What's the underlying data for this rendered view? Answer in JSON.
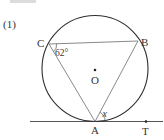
{
  "problem": {
    "number_label": "(1)"
  },
  "figure": {
    "circle": {
      "cx": 95,
      "cy": 68.5,
      "r": 53
    },
    "points": {
      "A": {
        "label": "A",
        "x": 95,
        "y": 121.5
      },
      "B": {
        "label": "B",
        "x": 138,
        "y": 41
      },
      "C": {
        "label": "C",
        "x": 49,
        "y": 44
      },
      "O": {
        "label": "O",
        "x": 95,
        "y": 70
      },
      "T": {
        "label": "T",
        "x": 146,
        "y": 121.5
      }
    },
    "angle_labels": {
      "angle_C": "62°",
      "angle_x": "x"
    },
    "tangent_line": {
      "x1": 30,
      "x2": 163,
      "y": 121.5
    },
    "colors": {
      "stroke": "#333333",
      "chord_stroke": "#6b6b6b",
      "header_bar": "#d8d8d8"
    }
  }
}
